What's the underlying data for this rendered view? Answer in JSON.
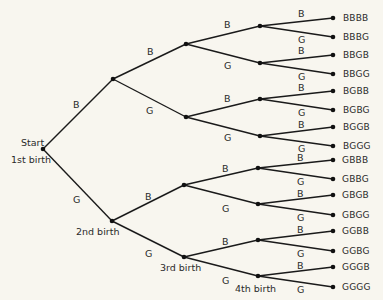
{
  "diagram": {
    "type": "tree",
    "levels": [
      "Start",
      "1st birth",
      "2nd birth",
      "3rd birth",
      "4th birth"
    ],
    "labels": {
      "start": "Start",
      "first": "1st birth",
      "second": "2nd birth",
      "third": "3rd birth",
      "fourth": "4th birth"
    },
    "branch": {
      "boy": "B",
      "girl": "G"
    },
    "outcomes": [
      "BBBB",
      "BBBG",
      "BBGB",
      "BBGG",
      "BGBB",
      "BGBG",
      "BGGB",
      "BGGG",
      "GBBB",
      "GBBG",
      "GBGB",
      "GBGG",
      "GGBB",
      "GGBG",
      "GGGB",
      "GGGG"
    ]
  }
}
